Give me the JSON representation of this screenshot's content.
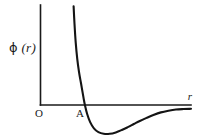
{
  "figure": {
    "background_color": "#ffffff",
    "ink_color": "#141414",
    "labels": {
      "y_axis": "ϕ (r)",
      "y_axis_symbol": "ϕ",
      "y_axis_argument": "(r)",
      "x_axis": "r",
      "origin": "O",
      "zero_crossing": "A"
    }
  },
  "chart_data": {
    "type": "line",
    "title": "",
    "subtitle": "",
    "xlabel": "r",
    "ylabel": "ϕ (r)",
    "grid": false,
    "legend": null,
    "axis_style": "open-corner-L",
    "xlim": [
      0,
      10
    ],
    "ylim": [
      -1.35,
      4.2
    ],
    "annotations": [
      {
        "label": "O",
        "x": 0,
        "y": 0,
        "note": "origin"
      },
      {
        "label": "A",
        "x": 2.95,
        "y": 0,
        "note": "zero crossing of potential"
      }
    ],
    "series": [
      {
        "name": "ϕ (r)",
        "color": "#141414",
        "x": [
          2.2,
          2.26,
          2.34,
          2.44,
          2.56,
          2.7,
          2.86,
          2.95,
          3.1,
          3.3,
          3.55,
          3.85,
          4.2,
          4.6,
          5.0,
          5.4,
          5.8,
          6.2,
          6.6,
          7.05,
          7.5,
          8.0,
          8.5,
          9.0,
          9.5,
          10.0
        ],
        "y": [
          4.15,
          3.4,
          2.62,
          1.95,
          1.38,
          0.88,
          0.3,
          0.0,
          -0.38,
          -0.72,
          -0.98,
          -1.14,
          -1.21,
          -1.21,
          -1.15,
          -1.05,
          -0.93,
          -0.8,
          -0.67,
          -0.54,
          -0.42,
          -0.31,
          -0.24,
          -0.19,
          -0.17,
          -0.16
        ]
      }
    ]
  }
}
